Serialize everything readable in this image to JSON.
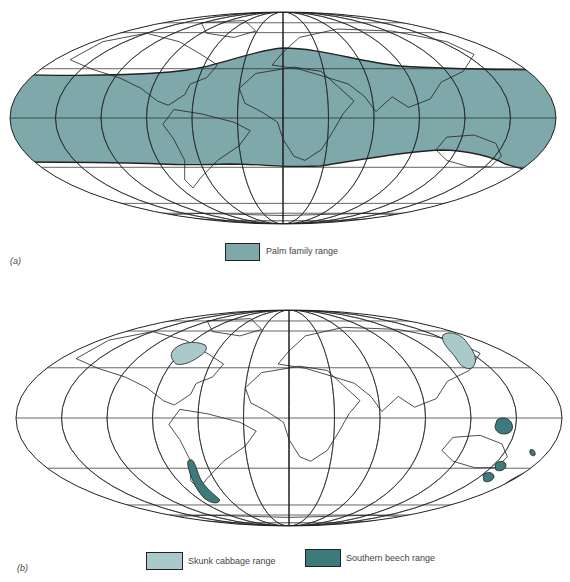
{
  "figure": {
    "panels": [
      {
        "id": "a",
        "label": "(a)",
        "legend": [
          {
            "label": "Palm family range",
            "color": "#7fa8ab"
          }
        ]
      },
      {
        "id": "b",
        "label": "(b)",
        "legend": [
          {
            "label": "Skunk cabbage range",
            "color": "#a9c9cb"
          },
          {
            "label": "Southern beech  range",
            "color": "#3c7a7c"
          }
        ]
      }
    ],
    "caption_fragment": ""
  },
  "colors": {
    "graticule": "#222222",
    "coast": "#222222",
    "palm": "#7fa8ab",
    "skunk": "#a9c9cb",
    "beech": "#3c7a7c"
  }
}
